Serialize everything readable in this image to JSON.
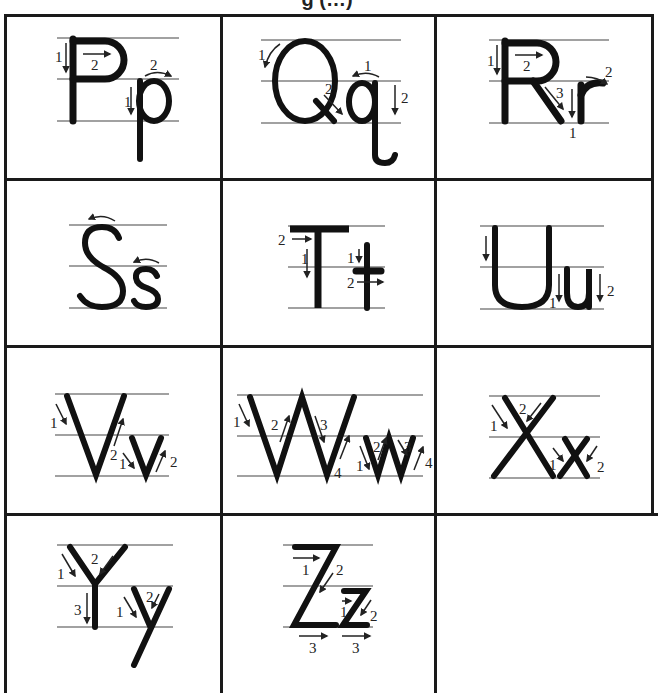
{
  "page": {
    "title_fragment": "g (…)",
    "worksheet_type": "Uppercase and lowercase letter formation guide with numbered stroke arrows"
  },
  "letters": [
    {
      "pair": "Pp",
      "upper": "P",
      "lower": "p",
      "upper_strokes": [
        "1",
        "2"
      ],
      "lower_strokes": [
        "1",
        "2"
      ]
    },
    {
      "pair": "Qq",
      "upper": "Q",
      "lower": "q",
      "upper_strokes": [
        "1",
        "2"
      ],
      "lower_strokes": [
        "1",
        "2"
      ]
    },
    {
      "pair": "Rr",
      "upper": "R",
      "lower": "r",
      "upper_strokes": [
        "1",
        "2",
        "3"
      ],
      "lower_strokes": [
        "1",
        "2"
      ]
    },
    {
      "pair": "Ss",
      "upper": "S",
      "lower": "s",
      "upper_strokes": [],
      "lower_strokes": []
    },
    {
      "pair": "Tt",
      "upper": "T",
      "lower": "t",
      "upper_strokes": [
        "1",
        "2"
      ],
      "lower_strokes": [
        "1",
        "2"
      ]
    },
    {
      "pair": "Uu",
      "upper": "U",
      "lower": "u",
      "upper_strokes": [],
      "lower_strokes": [
        "1",
        "2"
      ]
    },
    {
      "pair": "Vv",
      "upper": "V",
      "lower": "v",
      "upper_strokes": [
        "1",
        "2"
      ],
      "lower_strokes": [
        "1",
        "2"
      ]
    },
    {
      "pair": "Ww",
      "upper": "W",
      "lower": "w",
      "upper_strokes": [
        "1",
        "2",
        "3",
        "4"
      ],
      "lower_strokes": [
        "1",
        "2",
        "3",
        "4"
      ]
    },
    {
      "pair": "Xx",
      "upper": "X",
      "lower": "x",
      "upper_strokes": [
        "1",
        "2"
      ],
      "lower_strokes": [
        "1",
        "2"
      ]
    },
    {
      "pair": "Yy",
      "upper": "Y",
      "lower": "y",
      "upper_strokes": [
        "1",
        "2",
        "3"
      ],
      "lower_strokes": [
        "1",
        "2"
      ]
    },
    {
      "pair": "Zz",
      "upper": "Z",
      "lower": "z",
      "upper_strokes": [
        "1",
        "2",
        "3"
      ],
      "lower_strokes": [
        "1",
        "2",
        "3"
      ]
    }
  ],
  "labels": {
    "n1": "1",
    "n2": "2",
    "n3": "3",
    "n4": "4"
  }
}
